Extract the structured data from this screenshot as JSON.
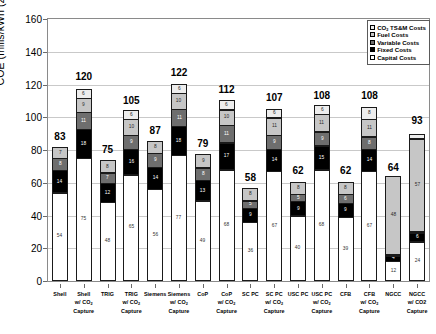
{
  "chart_data": {
    "type": "bar",
    "subtype": "stacked",
    "title": "",
    "xlabel": "",
    "ylabel": "COE (mills/kWh (2007$))",
    "ylim": [
      0,
      160
    ],
    "yticks": [
      0,
      20,
      40,
      60,
      80,
      100,
      120,
      140,
      160
    ],
    "grid": true,
    "legend_position": "top-right",
    "stack_order_bottom_to_top": [
      "Capital Costs",
      "Fixed Costs",
      "Variable Costs",
      "Fuel Costs",
      "CO2 TS&M Costs"
    ],
    "categories": [
      "Shell",
      "Shell w/ CO2 Capture",
      "TRIG",
      "TRIG w/ CO2 Capture",
      "Siemens",
      "Siemens w/ CO2 Capture",
      "CoP",
      "CoP w/ CO2 Capture",
      "SC PC",
      "SC PC w/ CO2 Capture",
      "USC PC",
      "USC PC w/ CO2 Capture",
      "CFB",
      "CFB w/ CO2 Capture",
      "NGCC",
      "NGCC w/ CO2 Capture"
    ],
    "series": [
      {
        "name": "Capital Costs",
        "values": [
          54,
          75,
          48,
          65,
          56,
          77,
          49,
          68,
          36,
          67,
          40,
          68,
          39,
          67,
          12,
          24
        ]
      },
      {
        "name": "Fixed Costs",
        "values": [
          14,
          18,
          12,
          16,
          14,
          18,
          13,
          17,
          9,
          14,
          9,
          15,
          9,
          14,
          4,
          6
        ]
      },
      {
        "name": "Variable Costs",
        "values": [
          8,
          11,
          7,
          9,
          9,
          11,
          8,
          11,
          5,
          9,
          5,
          9,
          6,
          8,
          1,
          1
        ]
      },
      {
        "name": "Fuel Costs",
        "values": [
          7,
          9,
          8,
          10,
          8,
          10,
          9,
          10,
          8,
          11,
          8,
          11,
          8,
          11,
          48,
          57
        ]
      },
      {
        "name": "CO2 TS&M Costs",
        "values": [
          0,
          6,
          0,
          6,
          0,
          6,
          0,
          6,
          0,
          6,
          0,
          6,
          0,
          8,
          0,
          3
        ]
      }
    ],
    "totals": [
      83,
      120,
      75,
      105,
      87,
      122,
      79,
      112,
      58,
      107,
      62,
      108,
      62,
      108,
      64,
      93
    ]
  },
  "legend": {
    "items": [
      {
        "label": "CO2 TS&M Costs",
        "color": "#ededed"
      },
      {
        "label": "Fuel Costs",
        "color": "#c6c6c6"
      },
      {
        "label": "Variable Costs",
        "color": "#6e6e6e"
      },
      {
        "label": "Fixed Costs",
        "color": "#000000"
      },
      {
        "label": "Capital Costs",
        "color": "#ffffff"
      }
    ]
  },
  "xaxis_labels": [
    {
      "line1": "Shell",
      "line2": "",
      "line3": ""
    },
    {
      "line1": "Shell",
      "line2": "w/ CO",
      "line3": "Capture"
    },
    {
      "line1": "TRIG",
      "line2": "",
      "line3": ""
    },
    {
      "line1": "TRIG",
      "line2": "w/ CO",
      "line3": "Capture"
    },
    {
      "line1": "Siemens",
      "line2": "",
      "line3": ""
    },
    {
      "line1": "Siemens",
      "line2": "w/ CO",
      "line3": "Capture"
    },
    {
      "line1": "CoP",
      "line2": "",
      "line3": ""
    },
    {
      "line1": "CoP",
      "line2": "w/ CO",
      "line3": "Capture"
    },
    {
      "line1": "SC PC",
      "line2": "",
      "line3": ""
    },
    {
      "line1": "SC PC",
      "line2": "w/ CO",
      "line3": "Capture"
    },
    {
      "line1": "USC PC",
      "line2": "",
      "line3": ""
    },
    {
      "line1": "USC PC",
      "line2": "w/ CO",
      "line3": "Capture"
    },
    {
      "line1": "CFB",
      "line2": "",
      "line3": ""
    },
    {
      "line1": "CFB",
      "line2": "w/ CO",
      "line3": "Capture"
    },
    {
      "line1": "NGCC",
      "line2": "",
      "line3": ""
    },
    {
      "line1": "NGCC",
      "line2": "w/ CO2",
      "line3": "Capture"
    }
  ]
}
